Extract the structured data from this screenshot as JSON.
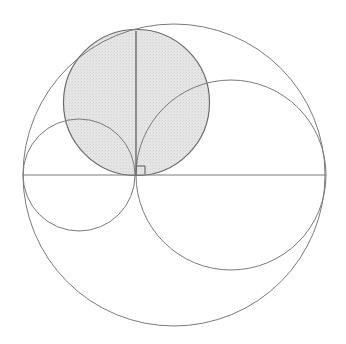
{
  "diagram": {
    "type": "geometry-arbelos",
    "colors": {
      "background": "#ffffff",
      "stroke": "#7a7a7a",
      "shade_fill": "#e4e4e4",
      "shade_stroke": "#6a6a6a"
    },
    "big_circle": {
      "cx": 174,
      "cy": 175,
      "r": 151
    },
    "left_circle": {
      "cx": 79,
      "cy": 175,
      "r": 56
    },
    "right_circle": {
      "cx": 231,
      "cy": 175,
      "r": 95
    },
    "shaded_circle": {
      "cx": 136.5,
      "cy": 102.5,
      "r": 73
    },
    "diameter_line": {
      "x1": 23,
      "y1": 175,
      "x2": 326,
      "y2": 175
    },
    "perpendicular_line": {
      "x1": 136,
      "y1": 31,
      "x2": 136,
      "y2": 175
    },
    "right_angle_marker": {
      "x": 137,
      "y": 166,
      "size": 8
    }
  }
}
